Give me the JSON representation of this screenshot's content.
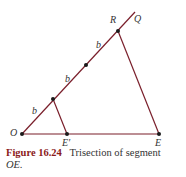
{
  "figure": {
    "number": "Figure 16.24",
    "caption_line1": "Trisection of segment",
    "caption_line2": "OE."
  },
  "labels": {
    "O": "O",
    "E_prime": "E′",
    "E": "E",
    "R": "R",
    "Q": "Q",
    "b1": "b",
    "b2": "b",
    "b3": "b"
  },
  "colors": {
    "line": "#7a1f2b",
    "point": "#1a1a1a",
    "caption_accent": "#8b1a1a"
  },
  "diagram": {
    "points": {
      "O": [
        22,
        134
      ],
      "E_prime": [
        67,
        134
      ],
      "E": [
        159,
        134
      ],
      "P1": [
        53,
        99
      ],
      "P2": [
        86,
        65
      ],
      "R": [
        118,
        31
      ],
      "Q_end": [
        135,
        12
      ]
    },
    "segments": [
      [
        "O",
        "Q_end"
      ],
      [
        "O",
        "E"
      ],
      [
        "P1",
        "E_prime"
      ],
      [
        "R",
        "E"
      ]
    ]
  }
}
